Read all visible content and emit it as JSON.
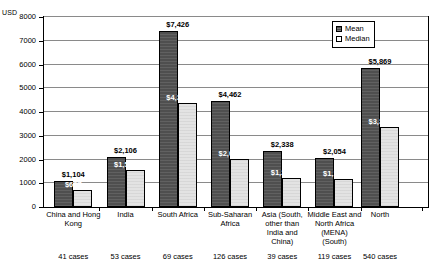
{
  "chart_data": {
    "type": "bar",
    "title": "",
    "xlabel": "",
    "ylabel": "USD",
    "ylim": [
      0,
      8000
    ],
    "ytick_values": [
      0,
      1000,
      2000,
      3000,
      4000,
      5000,
      6000,
      7000,
      8000
    ],
    "ytick_labels": [
      "0",
      "1000",
      "2000",
      "3000",
      "4000",
      "5000",
      "6000",
      "7000",
      "8000"
    ],
    "grid": true,
    "legend_position": "top-right",
    "categories": [
      "China and Hong Kong",
      "India",
      "South Africa",
      "Sub-Saharan Africa",
      "Asia (South, other than India and China)",
      "Middle East and North Africa (MENA) (South)",
      "North"
    ],
    "category_label_lines": [
      [
        "China and Hong",
        "Kong"
      ],
      [
        "India"
      ],
      [
        "South Africa"
      ],
      [
        "Sub-Saharan",
        "Africa"
      ],
      [
        "Asia (South,",
        "other than",
        "India and",
        "China)"
      ],
      [
        "Middle East and",
        "North Africa",
        "(MENA)",
        "(South)"
      ],
      [
        "North"
      ]
    ],
    "series": [
      {
        "name": "Mean",
        "color": "#4f4f4f",
        "values": [
          1104,
          2106,
          7426,
          4462,
          2338,
          2054,
          5869
        ],
        "labels": [
          "$1,104",
          "$2,106",
          "$7,426",
          "$4,462",
          "$2,338",
          "$2,054",
          "$5,869"
        ]
      },
      {
        "name": "Median",
        "color": "#e3e3e3",
        "values": [
          697,
          1557,
          4366,
          2029,
          1228,
          1163,
          3380
        ],
        "labels": [
          "$697",
          "$1,557",
          "$4,366",
          "$2,029",
          "$1,228",
          "$1,163",
          "$3,380"
        ]
      }
    ],
    "case_counts": [
      "41 cases",
      "53 cases",
      "69 cases",
      "126 cases",
      "39 cases",
      "119 cases",
      "540 cases"
    ]
  },
  "legend": {
    "items": [
      {
        "label": "Mean"
      },
      {
        "label": "Median"
      }
    ]
  }
}
